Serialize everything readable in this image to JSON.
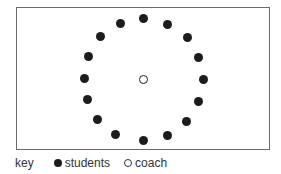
{
  "diagram": {
    "title": "",
    "field": {
      "left": 16,
      "top": 7,
      "right": 270,
      "bottom": 150
    },
    "students": [
      {
        "x": 143,
        "y": 18
      },
      {
        "x": 167,
        "y": 24
      },
      {
        "x": 187,
        "y": 37
      },
      {
        "x": 198,
        "y": 57
      },
      {
        "x": 203,
        "y": 79
      },
      {
        "x": 198,
        "y": 101
      },
      {
        "x": 186,
        "y": 121
      },
      {
        "x": 167,
        "y": 135
      },
      {
        "x": 143,
        "y": 140
      },
      {
        "x": 115,
        "y": 134
      },
      {
        "x": 97,
        "y": 119
      },
      {
        "x": 87,
        "y": 99
      },
      {
        "x": 84,
        "y": 78
      },
      {
        "x": 88,
        "y": 56
      },
      {
        "x": 100,
        "y": 36
      },
      {
        "x": 120,
        "y": 23
      }
    ],
    "coach": {
      "x": 143,
      "y": 79
    },
    "student_count": 16
  },
  "key": {
    "label": "key",
    "items": [
      {
        "symbol": "filled-circle",
        "label": "students"
      },
      {
        "symbol": "open-circle",
        "label": "coach"
      }
    ]
  },
  "colors": {
    "ink": "#1c1c1c",
    "border": "#6a6a6a",
    "background": "#ffffff"
  }
}
